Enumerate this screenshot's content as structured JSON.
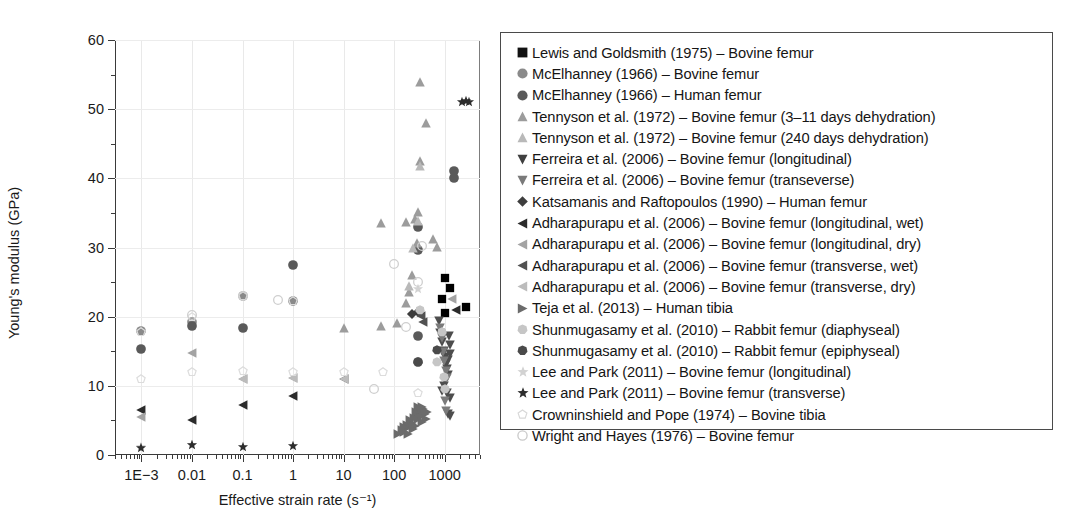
{
  "chart_data": {
    "type": "scatter",
    "title": "",
    "xlabel": "Effective strain rate (s⁻¹)",
    "ylabel": "Young's modulus (GPa)",
    "xscale": "log",
    "xlim": [
      0.0003,
      5000
    ],
    "ylim": [
      0,
      60
    ],
    "xticks": [
      "1E−3",
      "0.01",
      "0.1",
      "1",
      "10",
      "100",
      "1000"
    ],
    "xtick_values": [
      0.001,
      0.01,
      0.1,
      1,
      10,
      100,
      1000
    ],
    "yticks": [
      "0",
      "10",
      "20",
      "30",
      "40",
      "50",
      "60"
    ],
    "ytick_values": [
      0,
      10,
      20,
      30,
      40,
      50,
      60
    ],
    "yminor_values": [
      5,
      15,
      25,
      35,
      45,
      55
    ],
    "grid": "light gridlines at major ticks",
    "legend_position": "right, outside axes, boxed",
    "series": [
      {
        "name": "Lewis and Goldsmith (1975) – Bovine femur",
        "marker": "square",
        "color": "#000000",
        "points": [
          [
            1000,
            25.6
          ],
          [
            1300,
            24.2
          ],
          [
            900,
            22.5
          ],
          [
            1000,
            20.6
          ],
          [
            2700,
            21.4
          ]
        ]
      },
      {
        "name": "McElhanney (1966) – Bovine femur",
        "marker": "circle",
        "color": "#8a8a8a",
        "points": [
          [
            0.001,
            18.0
          ],
          [
            0.01,
            19.3
          ],
          [
            0.1,
            23.0
          ],
          [
            1,
            22.3
          ]
        ]
      },
      {
        "name": "McElhanney (1966) – Human femur",
        "marker": "circle",
        "color": "#5a5a5a",
        "points": [
          [
            0.001,
            15.3
          ],
          [
            0.01,
            18.7
          ],
          [
            0.1,
            18.4
          ],
          [
            1,
            27.5
          ],
          [
            300,
            33.0
          ],
          [
            300,
            29.6
          ],
          [
            1500,
            41.0
          ],
          [
            1500,
            40.1
          ],
          [
            300,
            17.2
          ],
          [
            300,
            13.5
          ]
        ]
      },
      {
        "name": "Tennyson et al. (1972) – Bovine femur (3–11 days dehydration)",
        "marker": "triangle-up",
        "color": "#9c9c9c",
        "points": [
          [
            10,
            18.3
          ],
          [
            55,
            18.6
          ],
          [
            115,
            19.1
          ],
          [
            170,
            22.0
          ],
          [
            200,
            23.5
          ],
          [
            230,
            26.0
          ],
          [
            280,
            30.6
          ],
          [
            300,
            35.2
          ],
          [
            330,
            42.5
          ],
          [
            430,
            48.0
          ],
          [
            330,
            54.0
          ],
          [
            55,
            33.5
          ],
          [
            170,
            33.7
          ],
          [
            260,
            34.1
          ],
          [
            600,
            31.2
          ],
          [
            700,
            30.1
          ]
        ]
      },
      {
        "name": "Tennyson et al. (1972) – Bovine femur (240 days dehydration)",
        "marker": "triangle-up",
        "color": "#b9b9b9",
        "points": [
          [
            330,
            41.8
          ],
          [
            300,
            33.9
          ],
          [
            240,
            30.0
          ],
          [
            200,
            24.5
          ]
        ]
      },
      {
        "name": "Ferreira et al. (2006) – Bovine femur (longitudinal)",
        "marker": "triangle-down",
        "color": "#4d4d4d",
        "points": [
          [
            780,
            19.4
          ],
          [
            820,
            17.6
          ],
          [
            900,
            16.4
          ],
          [
            950,
            15.0
          ],
          [
            1000,
            14.2
          ],
          [
            1050,
            13.1
          ],
          [
            1100,
            12.4
          ],
          [
            1150,
            11.6
          ],
          [
            1000,
            10.8
          ],
          [
            950,
            10.0
          ],
          [
            900,
            9.3
          ],
          [
            1200,
            17.2
          ],
          [
            1250,
            15.9
          ],
          [
            1300,
            14.6
          ],
          [
            1150,
            13.7
          ],
          [
            1100,
            9.0
          ],
          [
            1250,
            8.3
          ],
          [
            1150,
            5.9
          ],
          [
            1300,
            5.6
          ]
        ]
      },
      {
        "name": "Ferreira et al. (2006) – Bovine femur (transeverse)",
        "marker": "triangle-down",
        "color": "#7a7a7a",
        "points": [
          [
            800,
            18.3
          ],
          [
            870,
            16.9
          ],
          [
            920,
            14.9
          ],
          [
            980,
            13.6
          ],
          [
            1040,
            12.2
          ],
          [
            1100,
            11.2
          ],
          [
            1000,
            7.8
          ],
          [
            1080,
            6.3
          ]
        ]
      },
      {
        "name": "Katsamanis and Raftopoulos (1990) – Human femur",
        "marker": "diamond",
        "color": "#3d3d3d",
        "points": [
          [
            230,
            20.4
          ],
          [
            290,
            20.7
          ]
        ]
      },
      {
        "name": "Adharapurapu et al. (2006) – Bovine femur (longitudinal, wet)",
        "marker": "triangle-left",
        "color": "#2b2b2b",
        "points": [
          [
            0.001,
            6.5
          ],
          [
            0.01,
            5.1
          ],
          [
            0.1,
            7.3
          ],
          [
            1,
            8.6
          ],
          [
            1700,
            21.0
          ]
        ]
      },
      {
        "name": "Adharapurapu et al. (2006) – Bovine femur (longitudinal, dry)",
        "marker": "triangle-left",
        "color": "#a3a3a3",
        "points": [
          [
            0.001,
            5.5
          ],
          [
            0.01,
            14.8
          ],
          [
            0.1,
            11.0
          ],
          [
            1,
            11.1
          ],
          [
            1400,
            22.6
          ]
        ]
      },
      {
        "name": "Adharapurapu et al. (2006) – Bovine femur (transverse, wet)",
        "marker": "triangle-left",
        "color": "#515151",
        "points": [
          [
            10,
            11.0
          ],
          [
            340,
            20.1
          ],
          [
            380,
            19.3
          ]
        ]
      },
      {
        "name": "Adharapurapu et al. (2006) – Bovine femur (transverse, dry)",
        "marker": "triangle-left",
        "color": "#bcbcbc",
        "points": [
          [
            0.1,
            11.0
          ],
          [
            1,
            11.1
          ],
          [
            10,
            11.0
          ]
        ]
      },
      {
        "name": "Teja et al. (2013) – Human tibia",
        "marker": "triangle-right",
        "color": "#6b6b6b",
        "points": [
          [
            120,
            3.0
          ],
          [
            140,
            3.6
          ],
          [
            160,
            3.3
          ],
          [
            180,
            4.3
          ],
          [
            200,
            4.0
          ],
          [
            210,
            5.0
          ],
          [
            230,
            4.6
          ],
          [
            250,
            5.4
          ],
          [
            260,
            4.2
          ],
          [
            280,
            5.8
          ],
          [
            300,
            5.2
          ],
          [
            310,
            6.4
          ],
          [
            330,
            5.6
          ],
          [
            350,
            6.0
          ],
          [
            360,
            4.8
          ],
          [
            380,
            6.6
          ],
          [
            400,
            5.9
          ],
          [
            420,
            5.2
          ],
          [
            440,
            6.2
          ],
          [
            300,
            6.9
          ],
          [
            270,
            6.2
          ],
          [
            350,
            7.0
          ],
          [
            240,
            3.8
          ],
          [
            190,
            3.1
          ],
          [
            160,
            4.1
          ]
        ]
      },
      {
        "name": "Shunmugasamy et al. (2010) – Rabbit femur (diaphyseal)",
        "marker": "heptagon",
        "color": "#c6c6c6",
        "points": [
          [
            330,
            20.9
          ],
          [
            700,
            13.4
          ],
          [
            900,
            17.8
          ],
          [
            950,
            11.3
          ],
          [
            1000,
            9.6
          ]
        ]
      },
      {
        "name": "Shunmugasamy et al. (2010) – Rabbit femur (epiphyseal)",
        "marker": "heptagon",
        "color": "#4a4a4a",
        "points": [
          [
            300,
            13.5
          ],
          [
            700,
            15.2
          ]
        ]
      },
      {
        "name": "Lee and Park (2011) – Bovine femur (longitudinal)",
        "marker": "star",
        "color": "#d2d2d2",
        "points": [
          [
            0.001,
            1.1
          ],
          [
            0.01,
            1.5
          ],
          [
            300,
            24.0
          ]
        ]
      },
      {
        "name": "Lee and Park (2011) – Bovine femur (transverse)",
        "marker": "star",
        "color": "#2d2d2d",
        "points": [
          [
            0.001,
            1.0
          ],
          [
            0.01,
            1.5
          ],
          [
            0.1,
            1.2
          ],
          [
            1,
            1.3
          ],
          [
            2200,
            51.0
          ],
          [
            2600,
            51.2
          ],
          [
            3000,
            51.1
          ]
        ]
      },
      {
        "name": "Crowninshield and Pope (1974) – Bovine tibia",
        "marker": "pentagon-open",
        "color": "#dcdcdc",
        "points": [
          [
            0.001,
            11.0
          ],
          [
            0.01,
            12.0
          ],
          [
            0.1,
            12.1
          ],
          [
            1,
            12.0
          ],
          [
            10,
            12.0
          ],
          [
            60,
            12.0
          ],
          [
            0.001,
            17.8
          ],
          [
            0.01,
            20.0
          ],
          [
            0.1,
            23.0
          ],
          [
            1,
            22.3
          ],
          [
            300,
            9.0
          ]
        ]
      },
      {
        "name": "Wright and Hayes (1976) – Bovine femur",
        "marker": "circle-open",
        "color": "#cfcfcf",
        "points": [
          [
            0.01,
            20.3
          ],
          [
            0.1,
            23.0
          ],
          [
            0.5,
            22.4
          ],
          [
            100,
            27.6
          ],
          [
            300,
            25.0
          ],
          [
            350,
            30.2
          ],
          [
            170,
            18.5
          ],
          [
            40,
            9.5
          ]
        ]
      }
    ]
  },
  "legend": {
    "entries": [
      {
        "label": "Lewis and Goldsmith (1975) – Bovine femur",
        "marker": "square",
        "color": "#111111"
      },
      {
        "label": "McElhanney (1966) – Bovine femur",
        "marker": "circle",
        "color": "#8a8a8a"
      },
      {
        "label": "McElhanney (1966) – Human femur",
        "marker": "circle",
        "color": "#5a5a5a"
      },
      {
        "label": "Tennyson et al. (1972) – Bovine femur (3–11 days dehydration)",
        "marker": "triangle-up",
        "color": "#9c9c9c"
      },
      {
        "label": "Tennyson et al. (1972) – Bovine femur (240 days dehydration)",
        "marker": "triangle-up",
        "color": "#b9b9b9"
      },
      {
        "label": "Ferreira et al. (2006) – Bovine femur (longitudinal)",
        "marker": "triangle-down",
        "color": "#3f3f3f"
      },
      {
        "label": "Ferreira et al. (2006) – Bovine femur (transeverse)",
        "marker": "triangle-down",
        "color": "#7a7a7a"
      },
      {
        "label": "Katsamanis and Raftopoulos (1990) – Human femur",
        "marker": "diamond",
        "color": "#3d3d3d"
      },
      {
        "label": "Adharapurapu et al. (2006) – Bovine femur (longitudinal, wet)",
        "marker": "triangle-left",
        "color": "#2b2b2b"
      },
      {
        "label": "Adharapurapu et al. (2006) – Bovine femur (longitudinal, dry)",
        "marker": "triangle-left",
        "color": "#a3a3a3"
      },
      {
        "label": "Adharapurapu et al. (2006) – Bovine femur (transverse, wet)",
        "marker": "triangle-left",
        "color": "#515151"
      },
      {
        "label": "Adharapurapu et al. (2006) – Bovine femur (transverse, dry)",
        "marker": "triangle-left",
        "color": "#bcbcbc"
      },
      {
        "label": "Teja et al. (2013) – Human tibia",
        "marker": "triangle-right",
        "color": "#6b6b6b"
      },
      {
        "label": "Shunmugasamy et al. (2010) – Rabbit femur (diaphyseal)",
        "marker": "heptagon",
        "color": "#c6c6c6"
      },
      {
        "label": "Shunmugasamy et al. (2010) – Rabbit femur (epiphyseal)",
        "marker": "heptagon",
        "color": "#4a4a4a"
      },
      {
        "label": "Lee and Park (2011) – Bovine femur (longitudinal)",
        "marker": "star",
        "color": "#d2d2d2"
      },
      {
        "label": "Lee and Park (2011) – Bovine femur (transverse)",
        "marker": "star",
        "color": "#2d2d2d"
      },
      {
        "label": "Crowninshield and Pope (1974) – Bovine tibia",
        "marker": "pentagon-open",
        "color": "#d8d8d8"
      },
      {
        "label": "Wright and Hayes (1976) – Bovine femur",
        "marker": "circle-open",
        "color": "#c9c9c9"
      }
    ]
  }
}
